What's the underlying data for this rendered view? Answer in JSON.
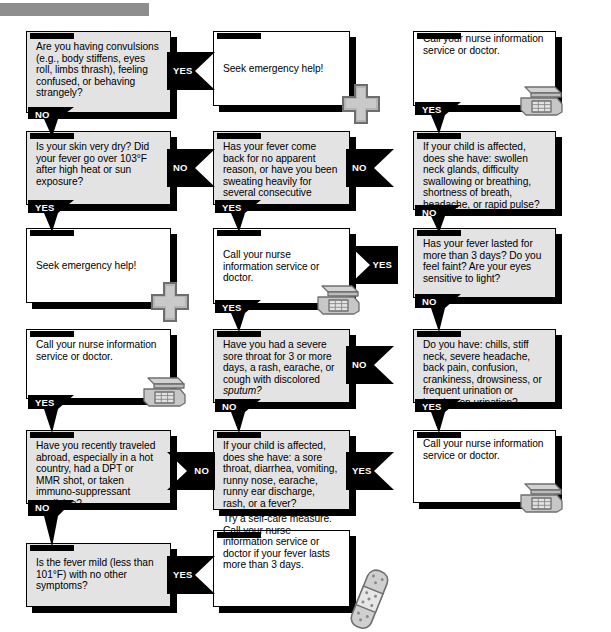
{
  "page": {
    "header_bar_color": "#8e8e8e",
    "question_box_color": "#e3e3e3",
    "action_box_color": "#ffffff",
    "connector_color": "#000000",
    "icon_color": "#b0b0b0"
  },
  "labels": {
    "yes": "YES",
    "no": "NO"
  },
  "nodes": [
    {
      "id": "q1",
      "kind": "question",
      "text": "Are you having convulsions (e.g., body stiffens, eyes roll, limbs thrash), feeling confused, or behaving strangely?"
    },
    {
      "id": "a1",
      "kind": "action",
      "text": "Seek emergency help!",
      "icon": "medical-cross-icon"
    },
    {
      "id": "a2",
      "kind": "action",
      "text": "Call your nurse information service or doctor.",
      "icon": "telephone-icon"
    },
    {
      "id": "q2",
      "kind": "question",
      "text": "Is your skin very dry?  Did your fever go over 103°F after high heat or sun exposure?"
    },
    {
      "id": "q3",
      "kind": "question",
      "text": "Has your fever come back for no apparent reason, or have you been sweating heavily for several consecutive nights?"
    },
    {
      "id": "q4",
      "kind": "question",
      "text": "If your child is affected, does she have: swollen neck glands, difficulty swallowing or breathing, shortness of breath, headache, or rapid pulse?"
    },
    {
      "id": "a3",
      "kind": "action",
      "text": "Seek emergency help!",
      "icon": "medical-cross-icon"
    },
    {
      "id": "a4",
      "kind": "action",
      "text": "Call your nurse information service or doctor.",
      "icon": "telephone-icon"
    },
    {
      "id": "q5",
      "kind": "question",
      "text": "Has your fever lasted for more than 3 days? Do you feel faint? Are your eyes sensitive to light?"
    },
    {
      "id": "a5",
      "kind": "action",
      "text": "Call your nurse information service or doctor.",
      "icon": "telephone-icon"
    },
    {
      "id": "q6",
      "kind": "question",
      "text": "Have you had a severe sore throat for 3 or more days, a rash, earache, or cough with discolored sputum?",
      "italic_tail": "sputum?"
    },
    {
      "id": "q7",
      "kind": "question",
      "text": "Do you have: chills, stiff neck, severe headache, back pain, confusion, crankiness, drowsiness, or frequent urination or burning on urination?"
    },
    {
      "id": "q8",
      "kind": "question",
      "text": "Have you recently traveled abroad, especially in a hot country, had a DPT or MMR shot, or taken immuno-suppressant medicine?"
    },
    {
      "id": "q9",
      "kind": "question",
      "text": "If your child is affected, does she have: a sore throat, diarrhea, vomiting, runny nose, earache, runny ear discharge, rash, or a fever?"
    },
    {
      "id": "a6",
      "kind": "action",
      "text": "Call your nurse information service or doctor.",
      "icon": "telephone-icon"
    },
    {
      "id": "q10",
      "kind": "question",
      "text": "Is the fever mild (less than 101°F) with no other symptoms?"
    },
    {
      "id": "a7",
      "kind": "action",
      "text": "Try a self-care measure. Call your nurse information service or doctor if your fever lasts more than 3 days.",
      "icon": "bandage-icon"
    }
  ],
  "connectors": [
    {
      "id": "c1",
      "from": "q1",
      "to": "a1",
      "label": "YES",
      "direction": "right"
    },
    {
      "id": "c2",
      "from": "q1",
      "to": "q2",
      "label": "NO",
      "direction": "down"
    },
    {
      "id": "c3",
      "from": "q2",
      "to": "q3",
      "label": "NO",
      "direction": "right"
    },
    {
      "id": "c4",
      "from": "q3",
      "to": "q4",
      "label": "NO",
      "direction": "right"
    },
    {
      "id": "c5",
      "from": "a2",
      "to": "q4",
      "label": "YES",
      "direction": "down"
    },
    {
      "id": "c6",
      "from": "q2",
      "to": "a3",
      "label": "YES",
      "direction": "down"
    },
    {
      "id": "c7",
      "from": "q3",
      "to": "a4",
      "label": "YES",
      "direction": "down"
    },
    {
      "id": "c8",
      "from": "q4",
      "to": "q5",
      "label": "NO",
      "direction": "down"
    },
    {
      "id": "c9",
      "from": "q5",
      "to": "a4",
      "label": "YES",
      "direction": "left"
    },
    {
      "id": "c10",
      "from": "a4",
      "to": "q6",
      "label": "YES",
      "direction": "down"
    },
    {
      "id": "c11",
      "from": "q5",
      "to": "q7",
      "label": "NO",
      "direction": "down"
    },
    {
      "id": "c12",
      "from": "q6",
      "to": "q7",
      "label": "NO",
      "direction": "right"
    },
    {
      "id": "c13",
      "from": "a5",
      "to": "q8",
      "label": "YES",
      "direction": "down"
    },
    {
      "id": "c14",
      "from": "q6",
      "to": "q9",
      "label": "NO",
      "direction": "down"
    },
    {
      "id": "c15",
      "from": "q7",
      "to": "a6",
      "label": "YES",
      "direction": "down"
    },
    {
      "id": "c16",
      "from": "q9",
      "to": "a6",
      "label": "YES",
      "direction": "right"
    },
    {
      "id": "c17",
      "from": "q8",
      "to": "q9",
      "label": "NO",
      "direction": "left"
    },
    {
      "id": "c18",
      "from": "q8",
      "to": "q10",
      "label": "NO",
      "direction": "down"
    },
    {
      "id": "c19",
      "from": "q10",
      "to": "a7",
      "label": "YES",
      "direction": "right"
    }
  ]
}
